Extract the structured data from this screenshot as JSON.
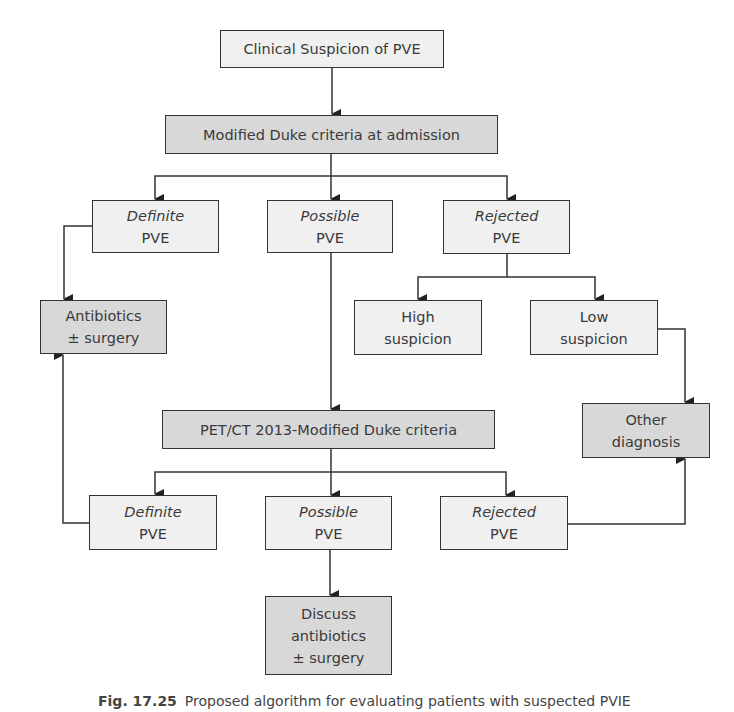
{
  "diagram": {
    "nodes": {
      "clinical_suspicion": {
        "line1": "Clinical Suspicion of PVE"
      },
      "duke_admission": {
        "line1": "Modified Duke criteria at admission"
      },
      "definite_1": {
        "line1": "Definite",
        "line2": "PVE"
      },
      "possible_1": {
        "line1": "Possible",
        "line2": "PVE"
      },
      "rejected_1": {
        "line1": "Rejected",
        "line2": "PVE"
      },
      "antibiotics": {
        "line1": "Antibiotics",
        "line2": "± surgery"
      },
      "high_suspicion": {
        "line1": "High",
        "line2": "suspicion"
      },
      "low_suspicion": {
        "line1": "Low",
        "line2": "suspicion"
      },
      "petct_duke": {
        "line1": "PET/CT 2013-Modified Duke criteria"
      },
      "other_diagnosis": {
        "line1": "Other",
        "line2": "diagnosis"
      },
      "definite_2": {
        "line1": "Definite",
        "line2": "PVE"
      },
      "possible_2": {
        "line1": "Possible",
        "line2": "PVE"
      },
      "rejected_2": {
        "line1": "Rejected",
        "line2": "PVE"
      },
      "discuss": {
        "line1": "Discuss",
        "line2": "antibiotics",
        "line3": "± surgery"
      }
    },
    "edges": [
      [
        "clinical_suspicion",
        "duke_admission"
      ],
      [
        "duke_admission",
        "definite_1"
      ],
      [
        "duke_admission",
        "possible_1"
      ],
      [
        "duke_admission",
        "rejected_1"
      ],
      [
        "definite_1",
        "antibiotics"
      ],
      [
        "possible_1",
        "petct_duke"
      ],
      [
        "rejected_1",
        "high_suspicion"
      ],
      [
        "rejected_1",
        "low_suspicion"
      ],
      [
        "low_suspicion",
        "other_diagnosis"
      ],
      [
        "petct_duke",
        "definite_2"
      ],
      [
        "petct_duke",
        "possible_2"
      ],
      [
        "petct_duke",
        "rejected_2"
      ],
      [
        "definite_2",
        "antibiotics"
      ],
      [
        "rejected_2",
        "other_diagnosis"
      ],
      [
        "possible_2",
        "discuss"
      ]
    ],
    "colors": {
      "light_fill": "#f0f0f0",
      "dark_fill": "#d8d8d8",
      "stroke": "#333333"
    }
  },
  "caption": {
    "label": "Fig. 17.25",
    "text": "Proposed algorithm for evaluating patients with suspected PVIE"
  }
}
